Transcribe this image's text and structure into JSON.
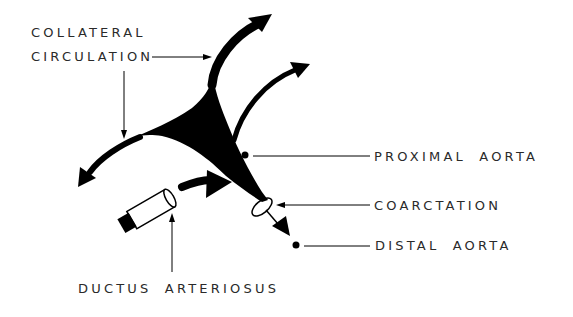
{
  "diagram": {
    "type": "anatomical-schematic",
    "colors": {
      "ink": "#000000",
      "text": "#2a2a2a",
      "background": "#ffffff"
    },
    "labels": {
      "collateral_line1": "COLLATERAL",
      "collateral_line2": "CIRCULATION",
      "proximal_aorta": "PROXIMAL AORTA",
      "coarctation": "COARCTATION",
      "distal_aorta": "DISTAL AORTA",
      "ductus_arteriosus": "DUCTUS ARTERIOSUS"
    }
  }
}
